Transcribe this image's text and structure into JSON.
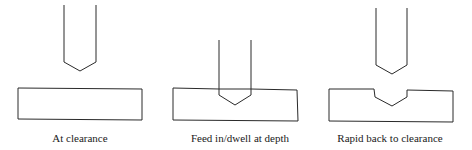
{
  "diagram": {
    "stroke_color": "#2a2a2a",
    "panels": [
      {
        "label": "At clearance",
        "label_x": 80,
        "tool": {
          "left": 64,
          "right": 96,
          "top": 5,
          "shoulder_y": 62,
          "tip_x": 80,
          "tip_y": 71
        },
        "workpiece": {
          "points": "18,88 142,89 142,120 18,119"
        }
      },
      {
        "label": "Feed in/dwell at depth",
        "label_x": 240,
        "tool": {
          "left": 219,
          "right": 251,
          "top": 40,
          "shoulder_y": 95,
          "tip_x": 235,
          "tip_y": 105
        },
        "workpiece": {
          "points": "173,88 219,89 251,89 297,90 298,121 173,120"
        }
      },
      {
        "label": "Rapid back to clearance",
        "label_x": 390,
        "tool": {
          "left": 376,
          "right": 407,
          "top": 8,
          "shoulder_y": 65,
          "tip_x": 392,
          "tip_y": 74
        },
        "workpiece": {
          "points": "329,89 374,89 375,97 392,106 407,97 407,90 453,91 453,122 329,121"
        }
      }
    ]
  }
}
